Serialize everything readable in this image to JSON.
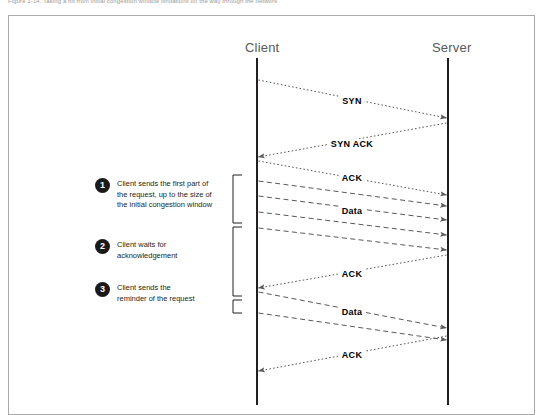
{
  "caption": "Figure 1-14. Taking a hit from initial congestion window limitations on the way through the network",
  "diagram": {
    "lifelines": [
      {
        "id": "client",
        "label": "Client",
        "x": 257
      },
      {
        "id": "server",
        "label": "Server",
        "x": 448
      }
    ],
    "messages": [
      {
        "id": "syn",
        "label": "SYN",
        "from": "client",
        "to": "server",
        "y_start": 80,
        "y_end": 118,
        "style": "dotted",
        "label_x": 352,
        "label_y": 101
      },
      {
        "id": "syn-ack",
        "label": "SYN ACK",
        "from": "server",
        "to": "client",
        "y_start": 123,
        "y_end": 157,
        "style": "dotted",
        "label_x": 352,
        "label_y": 144
      },
      {
        "id": "ack-1",
        "label": "ACK",
        "from": "client",
        "to": "server",
        "y_start": 161,
        "y_end": 195,
        "style": "dotted",
        "label_x": 352,
        "label_y": 178
      },
      {
        "id": "data-1",
        "label": "",
        "from": "client",
        "to": "server",
        "y_start": 181,
        "y_end": 206,
        "style": "dashed",
        "label_x": 0,
        "label_y": 0
      },
      {
        "id": "data-2",
        "label": "Data",
        "from": "client",
        "to": "server",
        "y_start": 196,
        "y_end": 220,
        "style": "dashed",
        "label_x": 352,
        "label_y": 211
      },
      {
        "id": "data-3",
        "label": "",
        "from": "client",
        "to": "server",
        "y_start": 212,
        "y_end": 235,
        "style": "dashed",
        "label_x": 0,
        "label_y": 0
      },
      {
        "id": "data-4",
        "label": "",
        "from": "client",
        "to": "server",
        "y_start": 228,
        "y_end": 250,
        "style": "dashed",
        "label_x": 0,
        "label_y": 0
      },
      {
        "id": "ack-2",
        "label": "ACK",
        "from": "server",
        "to": "client",
        "y_start": 255,
        "y_end": 288,
        "style": "dotted",
        "label_x": 352,
        "label_y": 274
      },
      {
        "id": "data-5",
        "label": "Data",
        "from": "client",
        "to": "server",
        "y_start": 292,
        "y_end": 328,
        "style": "dashed",
        "label_x": 352,
        "label_y": 312
      },
      {
        "id": "data-6",
        "label": "",
        "from": "client",
        "to": "server",
        "y_start": 313,
        "y_end": 340,
        "style": "dashed",
        "label_x": 0,
        "label_y": 0
      },
      {
        "id": "ack-3",
        "label": "ACK",
        "from": "server",
        "to": "client",
        "y_start": 336,
        "y_end": 371,
        "style": "dotted",
        "label_x": 352,
        "label_y": 355
      }
    ],
    "brackets": [
      {
        "id": "bracket-1",
        "y_top": 175,
        "y_bottom": 223
      },
      {
        "id": "bracket-2",
        "y_top": 227,
        "y_bottom": 296
      },
      {
        "id": "bracket-3",
        "y_top": 300,
        "y_bottom": 313
      }
    ],
    "annotations": [
      {
        "number": "1",
        "text": "Client sends the first part of\nthe request, up  to the size of\nthe initial congestion window",
        "x": 95,
        "y": 178
      },
      {
        "number": "2",
        "text": "Client waits for\nacknowledgement",
        "x": 95,
        "y": 239
      },
      {
        "number": "3",
        "text": "Client sends the\nreminder of the request",
        "x": 95,
        "y": 282
      }
    ]
  },
  "colors": {
    "lifeline": "#231f20",
    "arrow": "#58595b",
    "text": "#231f20",
    "header": "#58595b",
    "frame": "#aaaaaa",
    "badge": "#1a1a1a"
  }
}
